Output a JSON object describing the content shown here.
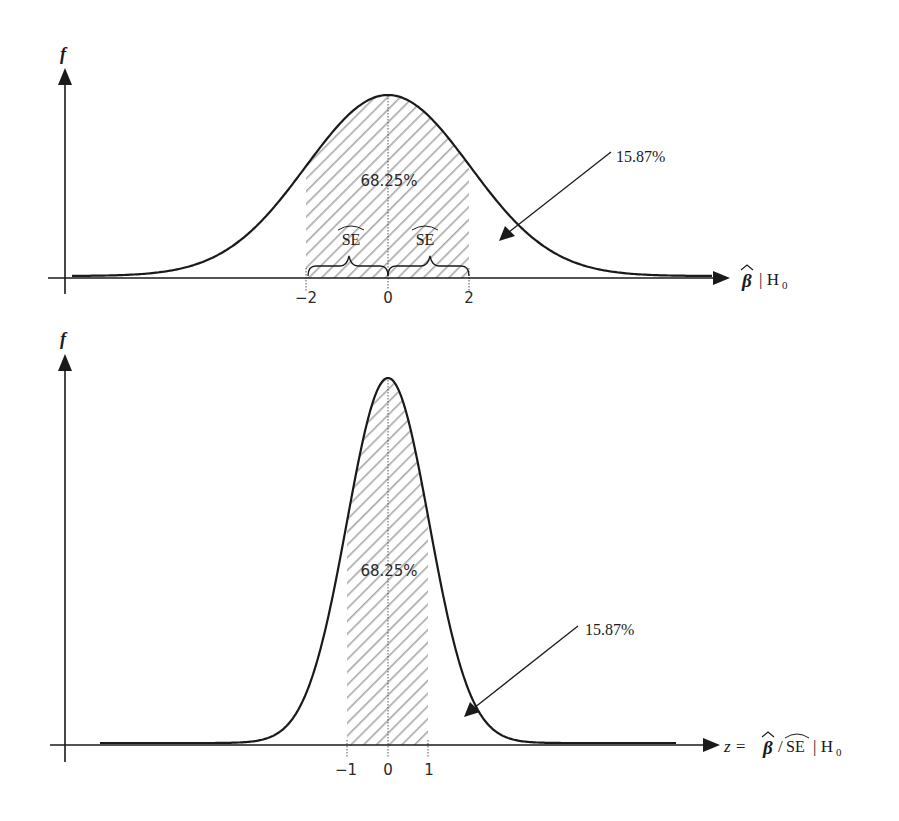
{
  "chart_data": [
    {
      "type": "area",
      "title": "",
      "description": "Sampling distribution of beta-hat under H0 (normal density), shaded ±2 region",
      "ylabel": "f",
      "xlabel": "β̂ | H₀",
      "x_ticks": [
        "−2",
        "0",
        "2"
      ],
      "x_tick_values": [
        -2,
        0,
        2
      ],
      "shaded_region": {
        "from": -2,
        "to": 2,
        "pattern": "diagonal-hatch",
        "label": "68.25%"
      },
      "tail_annotation": {
        "label": "15.87%",
        "points_to": "right tail"
      },
      "brace_labels": [
        "SE-hat",
        "SE-hat"
      ],
      "brace_label_text": "SE",
      "peak_x": 0,
      "grid": false,
      "legend": null
    },
    {
      "type": "area",
      "title": "",
      "description": "Standardized z statistic distribution under H0 (standard normal), shaded ±1 region",
      "ylabel": "f",
      "xlabel": "z = β̂ / SÊ | H₀",
      "x_ticks": [
        "−1",
        "0",
        "1"
      ],
      "x_tick_values": [
        -1,
        0,
        1
      ],
      "shaded_region": {
        "from": -1,
        "to": 1,
        "pattern": "diagonal-hatch",
        "label": "68.25%"
      },
      "tail_annotation": {
        "label": "15.87%",
        "points_to": "right tail"
      },
      "peak_x": 0,
      "grid": false,
      "legend": null
    }
  ],
  "top": {
    "y_label": "f",
    "x_label_beta": "β",
    "x_label_rest": "| H",
    "x_label_sub": "0",
    "ticks": [
      "−2",
      "0",
      "2"
    ],
    "center_pct": "68.25%",
    "tail_pct": "15.87%",
    "se_label": "SE"
  },
  "bottom": {
    "y_label": "f",
    "x_label_z": "z =",
    "x_label_beta": "β",
    "x_label_slash": "/",
    "x_label_se": "SE",
    "x_label_rest": "| H",
    "x_label_sub": "0",
    "ticks": [
      "−1",
      "0",
      "1"
    ],
    "center_pct": "68.25%",
    "tail_pct": "15.87%"
  },
  "colors": {
    "ink": "#1a1a1a",
    "hatch": "#a8a8a8",
    "background": "#ffffff"
  }
}
